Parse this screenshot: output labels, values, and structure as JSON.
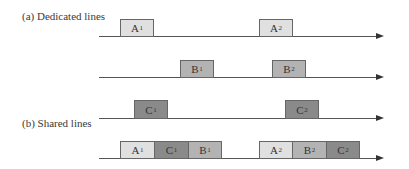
{
  "labels": {
    "dedicated": "(a) Dedicated lines",
    "shared": "(b) Shared lines"
  },
  "colors": {
    "A": "#e0e0e0",
    "B": "#b3b3b3",
    "C": "#8a8a8a",
    "line": "#555555"
  },
  "rows": {
    "a_line": {
      "blocks": [
        {
          "letter": "A",
          "sub": "1"
        },
        {
          "letter": "A",
          "sub": "2"
        }
      ]
    },
    "b_line": {
      "blocks": [
        {
          "letter": "B",
          "sub": "1"
        },
        {
          "letter": "B",
          "sub": "2"
        }
      ]
    },
    "c_line": {
      "blocks": [
        {
          "letter": "C",
          "sub": "1"
        },
        {
          "letter": "C",
          "sub": "2"
        }
      ]
    },
    "shared_line": {
      "blocks": [
        {
          "letter": "A",
          "sub": "1"
        },
        {
          "letter": "C",
          "sub": "1"
        },
        {
          "letter": "B",
          "sub": "1"
        },
        {
          "letter": "A",
          "sub": "2"
        },
        {
          "letter": "B",
          "sub": "2"
        },
        {
          "letter": "C",
          "sub": "2"
        }
      ]
    }
  }
}
